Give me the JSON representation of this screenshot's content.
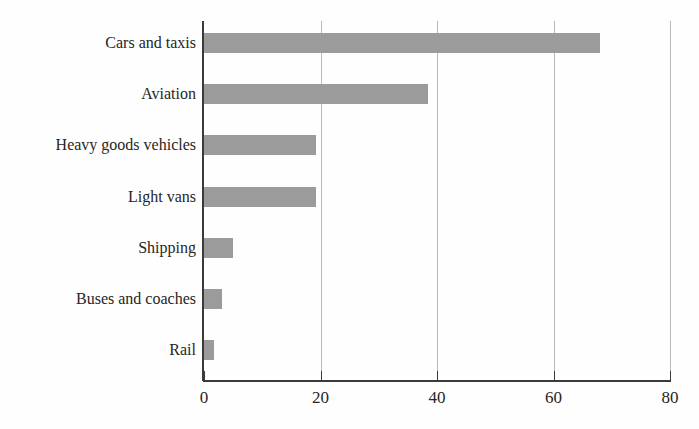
{
  "chart_data": {
    "type": "bar",
    "orientation": "horizontal",
    "title": "",
    "subtitle": "",
    "xlabel": "",
    "ylabel": "",
    "xlim": [
      0,
      80
    ],
    "xticks": [
      0,
      20,
      40,
      60,
      80
    ],
    "xtick_labels": [
      "0",
      "20",
      "40",
      "60",
      "80"
    ],
    "grid": "vertical",
    "legend": "none",
    "bar_color": "#9b9b9b",
    "axis_color": "#3a3a3a",
    "gridline_color": "#b9b9b9",
    "categories": [
      "Cars and taxis",
      "Aviation",
      "Heavy goods vehicles",
      "Light vans",
      "Shipping",
      "Buses and coaches",
      "Rail"
    ],
    "values": [
      68,
      38.5,
      19.2,
      19.2,
      5,
      3.1,
      1.7
    ],
    "series": [
      {
        "name": "",
        "values": [
          68,
          38.5,
          19.2,
          19.2,
          5,
          3.1,
          1.7
        ]
      }
    ]
  }
}
